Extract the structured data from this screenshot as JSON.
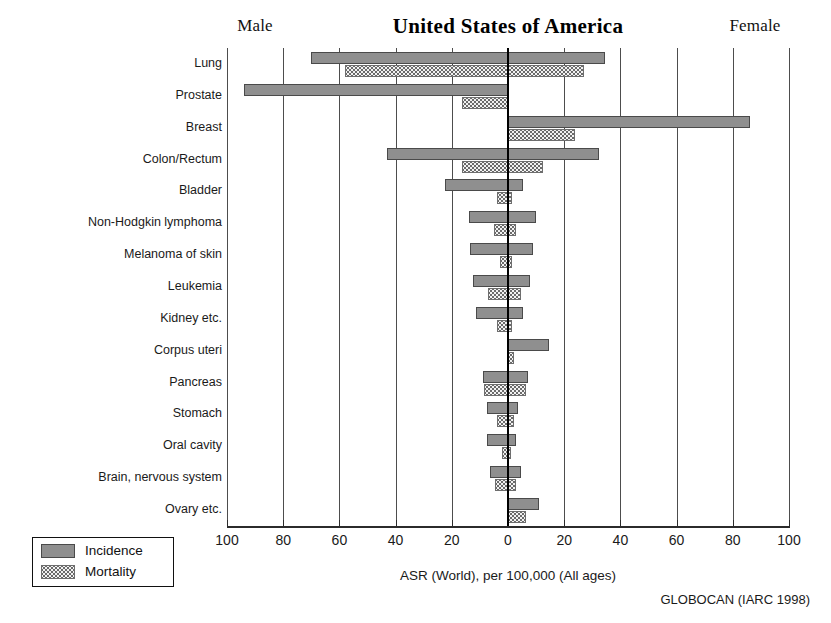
{
  "header": {
    "left_label": "Male",
    "title": "United States of America",
    "right_label": "Female"
  },
  "legend": {
    "incidence_label": "Incidence",
    "mortality_label": "Mortality"
  },
  "footer": {
    "x_axis_title": "ASR (World), per 100,000 (All ages)",
    "source": "GLOBOCAN (IARC 1998)"
  },
  "axis": {
    "tick_labels": [
      "100",
      "80",
      "60",
      "40",
      "20",
      "0",
      "20",
      "40",
      "60",
      "80",
      "100"
    ],
    "tick_values": [
      -100,
      -80,
      -60,
      -40,
      -20,
      0,
      20,
      40,
      60,
      80,
      100
    ],
    "max": 100
  },
  "chart_data": {
    "type": "bar",
    "title": "United States of America",
    "xlabel": "ASR (World), per 100,000 (All ages)",
    "ylabel": "",
    "xlim": [
      -100,
      100
    ],
    "grid": true,
    "legend_position": "bottom-left",
    "orientation": "horizontal-population-pyramid",
    "left_side": "Male",
    "right_side": "Female",
    "source": "GLOBOCAN (IARC 1998)",
    "categories": [
      "Lung",
      "Prostate",
      "Breast",
      "Colon/Rectum",
      "Bladder",
      "Non-Hodgkin lymphoma",
      "Melanoma of skin",
      "Leukemia",
      "Kidney etc.",
      "Corpus uteri",
      "Pancreas",
      "Stomach",
      "Oral cavity",
      "Brain, nervous system",
      "Ovary etc."
    ],
    "series": [
      {
        "name": "Incidence",
        "male": [
          70.0,
          94.0,
          0.0,
          43.0,
          22.5,
          14.0,
          13.5,
          12.5,
          11.5,
          0.0,
          9.0,
          7.5,
          7.5,
          6.5,
          0.0
        ],
        "female": [
          34.5,
          0.0,
          86.0,
          32.5,
          5.5,
          10.0,
          9.0,
          8.0,
          5.5,
          14.5,
          7.0,
          3.5,
          3.0,
          4.5,
          11.0
        ]
      },
      {
        "name": "Mortality",
        "male": [
          58.0,
          16.5,
          0.0,
          16.5,
          4.0,
          5.0,
          3.0,
          7.0,
          4.0,
          0.0,
          8.5,
          4.0,
          2.0,
          4.5,
          0.0
        ],
        "female": [
          27.0,
          0.0,
          24.0,
          12.5,
          1.5,
          3.0,
          1.5,
          4.5,
          1.5,
          2.0,
          6.5,
          2.0,
          1.0,
          3.0,
          6.5
        ]
      }
    ]
  }
}
